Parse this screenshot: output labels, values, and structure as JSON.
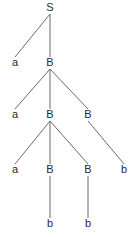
{
  "diagram": {
    "type": "parse-tree",
    "colors": {
      "edge": "#6a6a6a",
      "label": "#2a2a2a",
      "background": "#ffffff"
    },
    "nodes": [
      {
        "id": "n0",
        "label": "S",
        "level": 0,
        "col": 1
      },
      {
        "id": "n1",
        "label": "a",
        "level": 1,
        "col": 0
      },
      {
        "id": "n2",
        "label": "B",
        "level": 1,
        "col": 1
      },
      {
        "id": "n3",
        "label": "a",
        "level": 2,
        "col": 0
      },
      {
        "id": "n4",
        "label": "B",
        "level": 2,
        "col": 1
      },
      {
        "id": "n5",
        "label": "B",
        "level": 2,
        "col": 2
      },
      {
        "id": "n6",
        "label": "a",
        "level": 3,
        "col": 0
      },
      {
        "id": "n7",
        "label": "B",
        "level": 3,
        "col": 1
      },
      {
        "id": "n8",
        "label": "B",
        "level": 3,
        "col": 2
      },
      {
        "id": "n9",
        "label": "b",
        "level": 3,
        "col": 3
      },
      {
        "id": "n10",
        "label": "b",
        "level": 4,
        "col": 1
      },
      {
        "id": "n11",
        "label": "b",
        "level": 4,
        "col": 2
      }
    ],
    "edges": [
      [
        "n0",
        "n1"
      ],
      [
        "n0",
        "n2"
      ],
      [
        "n2",
        "n3"
      ],
      [
        "n2",
        "n4"
      ],
      [
        "n2",
        "n5"
      ],
      [
        "n4",
        "n6"
      ],
      [
        "n4",
        "n7"
      ],
      [
        "n4",
        "n8"
      ],
      [
        "n5",
        "n9"
      ],
      [
        "n7",
        "n10"
      ],
      [
        "n8",
        "n11"
      ]
    ]
  }
}
